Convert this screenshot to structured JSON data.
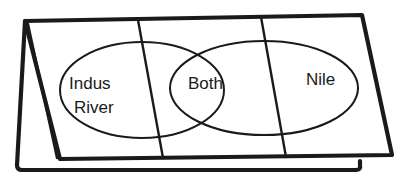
{
  "diagram": {
    "type": "venn-foldable",
    "sets": {
      "left": {
        "label_line1": "Indus",
        "label_line2": "River"
      },
      "overlap": {
        "label": "Both"
      },
      "right": {
        "label": "Nile"
      }
    },
    "panels": 3,
    "ink_color": "#1a1a1a",
    "paper_color": "#ffffff"
  }
}
